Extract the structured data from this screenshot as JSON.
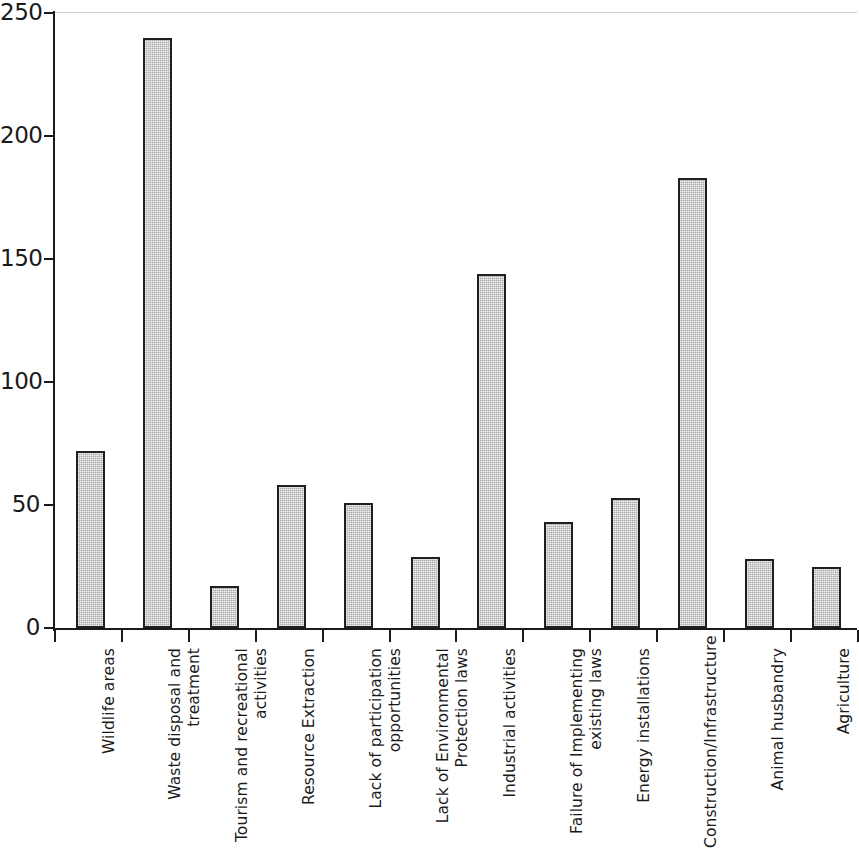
{
  "chart_data": {
    "type": "bar",
    "title": "",
    "subtitle": "",
    "xlabel": "",
    "ylabel": "",
    "ylim": [
      0,
      250
    ],
    "yticks": [
      0,
      50,
      100,
      150,
      200,
      250
    ],
    "grid": false,
    "legend": null,
    "orientation": "vertical",
    "bar_color": "#a9a9a9",
    "bar_edge_color": "#1f1f1f",
    "categories": [
      "Wildlife areas",
      "Waste disposal and\ntreatment",
      "Tourism and recreational\nactivities",
      "Resource Extraction",
      "Lack of participation\nopportunities",
      "Lack of Environmental\nProtection laws",
      "Industrial activities",
      "Failure of Implementing\nexisting laws",
      "Energy installations",
      "Construction/Infrastructure",
      "Animal husbandry",
      "Agriculture"
    ],
    "values": [
      72,
      240,
      17,
      58,
      51,
      29,
      144,
      43,
      53,
      183,
      28,
      25
    ]
  },
  "axis": {
    "y_tick_labels": [
      "250",
      "200",
      "150",
      "100",
      "50",
      "0"
    ]
  }
}
